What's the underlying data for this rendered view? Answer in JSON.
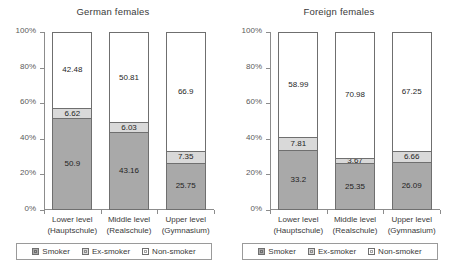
{
  "chart_data": [
    {
      "type": "bar",
      "title": "German females",
      "xlabel": "",
      "ylabel": "",
      "ylim": [
        0,
        100
      ],
      "stacked": true,
      "stack_mode": "percent",
      "grid": false,
      "legend_position": "bottom",
      "axis_ticks": [
        "0%",
        "20%",
        "40%",
        "60%",
        "80%",
        "100%"
      ],
      "categories": [
        "Lower level (Hauptschule)",
        "Middle level (Realschule)",
        "Upper level (Gymnasium)"
      ],
      "category_lines": [
        [
          "Lower level",
          "(Hauptschule)"
        ],
        [
          "Middle level",
          "(Realschule)"
        ],
        [
          "Upper level",
          "(Gymnasium)"
        ]
      ],
      "series": [
        {
          "name": "Smoker",
          "color": "#a9a9a9",
          "values": [
            50.9,
            43.16,
            25.75
          ],
          "labels": [
            "50.9",
            "43.16",
            "25.75"
          ]
        },
        {
          "name": "Ex-smoker",
          "color": "#d9d9d9",
          "values": [
            6.62,
            6.03,
            7.35
          ],
          "labels": [
            "6.62",
            "6.03",
            "7.35"
          ]
        },
        {
          "name": "Non-smoker",
          "color": "#ffffff",
          "values": [
            42.48,
            50.81,
            66.9
          ],
          "labels": [
            "42.48",
            "50.81",
            "66.9"
          ]
        }
      ]
    },
    {
      "type": "bar",
      "title": "Foreign females",
      "xlabel": "",
      "ylabel": "",
      "ylim": [
        0,
        100
      ],
      "stacked": true,
      "stack_mode": "percent",
      "grid": false,
      "legend_position": "bottom",
      "axis_ticks": [
        "0%",
        "20%",
        "40%",
        "60%",
        "80%",
        "100%"
      ],
      "categories": [
        "Lower level (Hauptschule)",
        "Middle level (Realschule)",
        "Upper level (Gymnasium)"
      ],
      "category_lines": [
        [
          "Lower level",
          "(Hauptschule)"
        ],
        [
          "Middle level",
          "(Realschule)"
        ],
        [
          "Upper level",
          "(Gymnasium)"
        ]
      ],
      "series": [
        {
          "name": "Smoker",
          "color": "#a9a9a9",
          "values": [
            33.2,
            25.35,
            26.09
          ],
          "labels": [
            "33.2",
            "25.35",
            "26.09"
          ]
        },
        {
          "name": "Ex-smoker",
          "color": "#d9d9d9",
          "values": [
            7.81,
            3.67,
            6.66
          ],
          "labels": [
            "7.81",
            "3.67",
            "6.66"
          ]
        },
        {
          "name": "Non-smoker",
          "color": "#ffffff",
          "values": [
            58.99,
            70.98,
            67.25
          ],
          "labels": [
            "58.99",
            "70.98",
            "67.25"
          ]
        }
      ]
    }
  ],
  "legend": {
    "items": [
      {
        "label": "Smoker",
        "color": "#a9a9a9"
      },
      {
        "label": "Ex-smoker",
        "color": "#d9d9d9"
      },
      {
        "label": "Non-smoker",
        "color": "#ffffff"
      }
    ]
  }
}
